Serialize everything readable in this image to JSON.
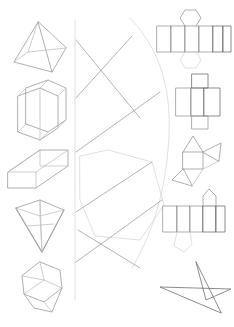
{
  "page": {
    "background_color": "#ffffff",
    "line_color": "#8d8d92",
    "soft_line_color": "#b9b9be",
    "faint_line_color": "#d2d2d6",
    "width": 234,
    "height": 327
  },
  "top_strip": {
    "description": "Faint clipped row of interface controls at the very top edge",
    "visible": true
  },
  "left_column": {
    "label": "Three-dimensional solids",
    "items": [
      {
        "name": "square-pyramid",
        "label": "Square pyramid",
        "index": 1
      },
      {
        "name": "hexagonal-prism",
        "label": "Hexagonal prism",
        "index": 2
      },
      {
        "name": "rectangular-prism",
        "label": "Rectangular prism",
        "index": 3
      },
      {
        "name": "inverted-pyramid",
        "label": "Inverted pyramid",
        "index": 4
      },
      {
        "name": "oblique-prism",
        "label": "Oblique prism",
        "index": 5
      }
    ]
  },
  "right_column": {
    "label": "Two-dimensional nets",
    "items": [
      {
        "name": "hexagonal-prism-net",
        "label": "Hexagonal prism net",
        "index": 1
      },
      {
        "name": "cuboid-net",
        "label": "Cuboid net",
        "index": 2
      },
      {
        "name": "triangular-prism-net",
        "label": "Triangular prism net",
        "index": 3
      },
      {
        "name": "pentagonal-prism-net",
        "label": "Pentagonal prism net",
        "index": 4
      },
      {
        "name": "five-pointed-star",
        "label": "Five pointed star",
        "index": 5
      }
    ]
  },
  "center_region": {
    "label": "Matching area with connector lines",
    "elements": [
      {
        "name": "vertical-divider",
        "label": "Vertical divider line"
      },
      {
        "name": "hexagon-outline",
        "label": "Large hexagon outline"
      },
      {
        "name": "crossing-lines",
        "label": "Crossing connector lines"
      },
      {
        "name": "arc-curve",
        "label": "Large light arc"
      }
    ]
  }
}
